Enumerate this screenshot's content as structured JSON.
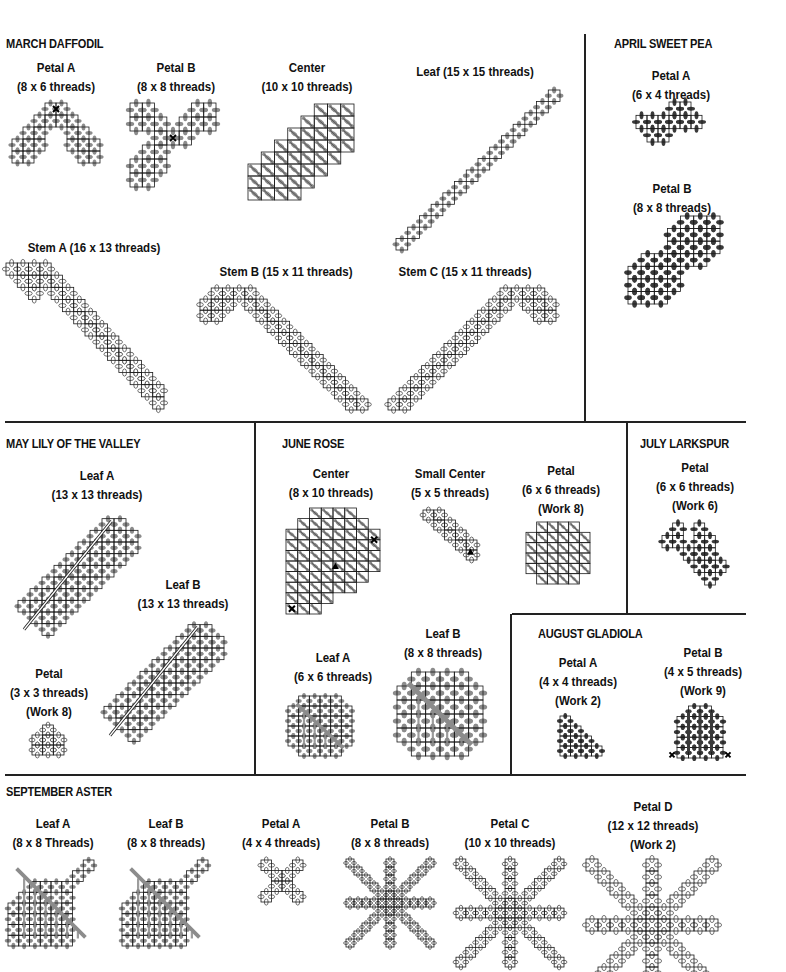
{
  "colors": {
    "line": "#222222",
    "grid": "#1a1a1a",
    "stitch_gray": "#8c8c8c",
    "stitch_dark": "#3a3a3a",
    "stitch_outline": "#333333"
  },
  "dividers": {
    "h": [
      {
        "x": 5,
        "y": 421,
        "w": 741
      },
      {
        "x": 5,
        "y": 774,
        "w": 741
      },
      {
        "x": 512,
        "y": 613,
        "w": 234
      }
    ],
    "v": [
      {
        "x": 584,
        "y": 34,
        "h": 388
      },
      {
        "x": 254,
        "y": 422,
        "h": 353
      },
      {
        "x": 626,
        "y": 422,
        "h": 192
      },
      {
        "x": 510,
        "y": 614,
        "h": 161
      }
    ]
  },
  "sections": [
    {
      "id": "march",
      "title": "MARCH DAFFODIL",
      "x": 6,
      "y": 37
    },
    {
      "id": "april",
      "title": "APRIL SWEET PEA",
      "x": 614,
      "y": 37
    },
    {
      "id": "may",
      "title": "MAY LILY OF THE VALLEY",
      "x": 6,
      "y": 437
    },
    {
      "id": "june",
      "title": "JUNE ROSE",
      "x": 282,
      "y": 437
    },
    {
      "id": "july",
      "title": "JULY LARKSPUR",
      "x": 640,
      "y": 437
    },
    {
      "id": "august",
      "title": "AUGUST GLADIOLA",
      "x": 538,
      "y": 627
    },
    {
      "id": "september",
      "title": "SEPTEMBER ASTER",
      "x": 6,
      "y": 785
    }
  ],
  "motifs": [
    {
      "section": "march",
      "name": "Petal A",
      "dims": "(8 x 6 threads)",
      "work": "",
      "cx": 56,
      "cy": 59,
      "shape": "chevron",
      "x": 12,
      "y": 103,
      "w": 88,
      "h": 60,
      "stitch": "gray",
      "marker": "x-top"
    },
    {
      "section": "march",
      "name": "Petal B",
      "dims": "(8 x 8 threads)",
      "work": "",
      "cx": 176,
      "cy": 59,
      "shape": "trefoil",
      "x": 130,
      "y": 103,
      "w": 86,
      "h": 84,
      "stitch": "gray",
      "marker": "x-center"
    },
    {
      "section": "march",
      "name": "Center",
      "dims": "(10 x 10 threads)",
      "work": "",
      "cx": 307,
      "cy": 59,
      "shape": "diagband",
      "x": 248,
      "y": 104,
      "w": 106,
      "h": 96,
      "stitch": "hatch",
      "marker": ""
    },
    {
      "section": "march",
      "name": "Leaf",
      "dims": "(15 x 15 threads)",
      "work": "",
      "cx": 475,
      "cy": 63,
      "single": true,
      "shape": "diagline",
      "x": 396,
      "y": 90,
      "w": 164,
      "h": 160,
      "stitch": "gray",
      "marker": ""
    },
    {
      "section": "march",
      "name": "Stem A",
      "dims": "(16 x 13 threads)",
      "work": "",
      "cx": 94,
      "cy": 239,
      "single": true,
      "shape": "stemA",
      "x": 6,
      "y": 263,
      "w": 158,
      "h": 146,
      "stitch": "outline",
      "marker": ""
    },
    {
      "section": "march",
      "name": "Stem B",
      "dims": "(15 x 11 threads)",
      "work": "",
      "cx": 286,
      "cy": 263,
      "single": true,
      "shape": "stemB",
      "x": 200,
      "y": 288,
      "w": 168,
      "h": 122,
      "stitch": "outline",
      "marker": ""
    },
    {
      "section": "march",
      "name": "Stem C",
      "dims": "(15 x 11 threads)",
      "work": "",
      "cx": 465,
      "cy": 263,
      "single": true,
      "shape": "stemC",
      "x": 388,
      "y": 288,
      "w": 168,
      "h": 122,
      "stitch": "outline",
      "marker": ""
    },
    {
      "section": "april",
      "name": "Petal A",
      "dims": "(6 x 4 threads)",
      "work": "",
      "cx": 671,
      "cy": 67,
      "shape": "peaA",
      "x": 636,
      "y": 102,
      "w": 66,
      "h": 40,
      "stitch": "dark",
      "marker": ""
    },
    {
      "section": "april",
      "name": "Petal B",
      "dims": "(8 x 8 threads)",
      "work": "",
      "cx": 672,
      "cy": 180,
      "shape": "peaB",
      "x": 628,
      "y": 216,
      "w": 92,
      "h": 88,
      "stitch": "dark",
      "marker": ""
    },
    {
      "section": "may",
      "name": "Leaf A",
      "dims": "(13 x 13 threads)",
      "work": "",
      "cx": 97,
      "cy": 467,
      "shape": "leafdiag",
      "x": 6,
      "y": 507,
      "w": 144,
      "h": 140,
      "stitch": "gray",
      "marker": ""
    },
    {
      "section": "may",
      "name": "Leaf B",
      "dims": "(13 x 13 threads)",
      "work": "",
      "cx": 183,
      "cy": 576,
      "shape": "leafdiag",
      "x": 92,
      "y": 613,
      "w": 144,
      "h": 140,
      "stitch": "gray",
      "marker": ""
    },
    {
      "section": "may",
      "name": "Petal",
      "dims": "(3 x 3 threads)",
      "work": "(Work 8)",
      "cx": 49,
      "cy": 665,
      "shape": "smallpetal",
      "x": 32,
      "y": 725,
      "w": 32,
      "h": 30,
      "stitch": "outline",
      "marker": ""
    },
    {
      "section": "june",
      "name": "Center",
      "dims": "(8 x 10 threads)",
      "work": "",
      "cx": 331,
      "cy": 465,
      "shape": "roseCenter",
      "x": 286,
      "y": 508,
      "w": 94,
      "h": 106,
      "stitch": "hatch",
      "marker": "x-tri"
    },
    {
      "section": "june",
      "name": "Small Center",
      "dims": "(5 x 5 threads)",
      "work": "",
      "cx": 450,
      "cy": 465,
      "shape": "smallcenter",
      "x": 423,
      "y": 510,
      "w": 54,
      "h": 50,
      "stitch": "outline",
      "marker": "tri"
    },
    {
      "section": "june",
      "name": "Petal",
      "dims": "(6 x 6 threads)",
      "work": "(Work 8)",
      "cx": 561,
      "cy": 462,
      "shape": "octo",
      "x": 526,
      "y": 522,
      "w": 64,
      "h": 62,
      "stitch": "hatch",
      "marker": ""
    },
    {
      "section": "june",
      "name": "Leaf A",
      "dims": "(6 x 6 threads)",
      "work": "",
      "cx": 333,
      "cy": 649,
      "shape": "octoleaf",
      "x": 288,
      "y": 696,
      "w": 64,
      "h": 60,
      "stitch": "gray",
      "marker": ""
    },
    {
      "section": "june",
      "name": "Leaf B",
      "dims": "(8 x 8 threads)",
      "work": "",
      "cx": 443,
      "cy": 625,
      "shape": "octoleaf",
      "x": 397,
      "y": 672,
      "w": 86,
      "h": 84,
      "stitch": "gray",
      "marker": ""
    },
    {
      "section": "july",
      "name": "Petal",
      "dims": "(6 x 6 threads)",
      "work": "(Work 6)",
      "cx": 695,
      "cy": 459,
      "shape": "larkspur",
      "x": 662,
      "y": 523,
      "w": 64,
      "h": 62,
      "stitch": "dark",
      "marker": ""
    },
    {
      "section": "august",
      "name": "Petal A",
      "dims": "(4 x 4 threads)",
      "work": "(Work 2)",
      "cx": 578,
      "cy": 654,
      "shape": "triangle",
      "x": 560,
      "y": 716,
      "w": 42,
      "h": 40,
      "stitch": "dark",
      "marker": ""
    },
    {
      "section": "august",
      "name": "Petal B",
      "dims": "(4 x 5 threads)",
      "work": "(Work 9)",
      "cx": 703,
      "cy": 644,
      "shape": "arch",
      "x": 677,
      "y": 706,
      "w": 46,
      "h": 52,
      "stitch": "dark",
      "marker": "x-sides"
    },
    {
      "section": "september",
      "name": "Leaf A",
      "dims": "(8 x 8 Threads)",
      "work": "",
      "cx": 53,
      "cy": 815,
      "shape": "asterLeaf",
      "x": 8,
      "y": 860,
      "w": 86,
      "h": 86,
      "stitch": "grid-gray",
      "marker": ""
    },
    {
      "section": "september",
      "name": "Leaf B",
      "dims": "(8 x 8 threads)",
      "work": "",
      "cx": 166,
      "cy": 815,
      "shape": "asterLeaf",
      "x": 122,
      "y": 860,
      "w": 86,
      "h": 86,
      "stitch": "grid-gray",
      "marker": ""
    },
    {
      "section": "september",
      "name": "Petal A",
      "dims": "(4 x 4 threads)",
      "work": "",
      "cx": 281,
      "cy": 815,
      "shape": "cross4",
      "x": 261,
      "y": 860,
      "w": 42,
      "h": 42,
      "stitch": "outline",
      "marker": ""
    },
    {
      "section": "september",
      "name": "Petal B",
      "dims": "(8 x 8 threads)",
      "work": "",
      "cx": 390,
      "cy": 815,
      "shape": "star",
      "x": 346,
      "y": 859,
      "w": 88,
      "h": 88,
      "stitch": "outline",
      "marker": ""
    },
    {
      "section": "september",
      "name": "Petal C",
      "dims": "(10 x 10 threads)",
      "work": "",
      "cx": 510,
      "cy": 815,
      "shape": "star",
      "x": 456,
      "y": 859,
      "w": 108,
      "h": 108,
      "stitch": "outline",
      "marker": ""
    },
    {
      "section": "september",
      "name": "Petal D",
      "dims": "(12 x 12 threads)",
      "work": "(Work 2)",
      "cx": 653,
      "cy": 798,
      "shape": "star",
      "x": 586,
      "y": 859,
      "w": 132,
      "h": 132,
      "stitch": "outline",
      "marker": ""
    }
  ]
}
